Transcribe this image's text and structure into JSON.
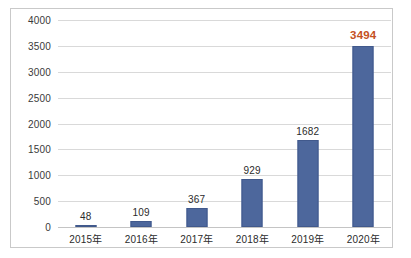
{
  "chart_data": {
    "type": "bar",
    "title": "",
    "subtitle": "",
    "xlabel": "",
    "ylabel": "",
    "categories": [
      "2015年",
      "2016年",
      "2017年",
      "2018年",
      "2019年",
      "2020年"
    ],
    "values": [
      48,
      109,
      367,
      929,
      1682,
      3494
    ],
    "data_labels": [
      "48",
      "109",
      "367",
      "929",
      "1682",
      "3494"
    ],
    "highlight_index": 5,
    "ylim": [
      0,
      4000
    ],
    "ytick_values": [
      0,
      500,
      1000,
      1500,
      2000,
      2500,
      3000,
      3500,
      4000
    ],
    "ytick_labels": [
      "0",
      "500",
      "1000",
      "1500",
      "2000",
      "2500",
      "3000",
      "3500",
      "4000"
    ],
    "grid": true,
    "legend": false,
    "legend_position": "none",
    "series": [
      {
        "name": "",
        "values": [
          48,
          109,
          367,
          929,
          1682,
          3494
        ]
      }
    ]
  },
  "style": {
    "bar_color": "#4d679c",
    "bar_border_color": "#41598c",
    "highlight_label_color": "#c4511f",
    "label_color": "#2b2b2b",
    "tick_color": "#3a3a3a",
    "gridline_color": "#d9d9d9",
    "baseline_color": "#c4c4c4",
    "frame_border_color": "#c9c9c9",
    "background": "#ffffff"
  }
}
